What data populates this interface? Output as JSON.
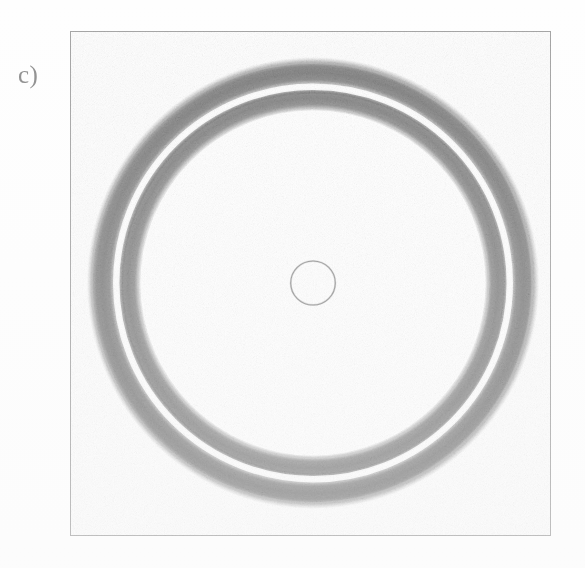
{
  "figure": {
    "panel_label": "c)",
    "caption_text": "",
    "background_color": "#fefefe"
  },
  "frame": {
    "name": "plot-frame",
    "x": 70,
    "y": 31,
    "width": 481,
    "height": 505,
    "border_color": "#b4b4b4",
    "border_width": 1.15
  },
  "chart_data": {
    "type": "scatter",
    "title": "",
    "subtitle": "",
    "xlabel": "",
    "ylabel": "",
    "annotations": [
      "c)"
    ],
    "legend": [],
    "legend_position": "none",
    "grid": false,
    "axis_ticks": false,
    "tick_labels": [],
    "xlim": [
      0,
      1
    ],
    "ylim": [
      0,
      1
    ],
    "center": {
      "x": 313,
      "y": 283
    },
    "ink_color": "#9a9a9a",
    "series": [
      {
        "name": "outer-annulus",
        "shape": "annulus",
        "outer_radius": 222,
        "inner_radius": 200,
        "mean_radius": 211,
        "band_width": 22,
        "fill": "#8f8f8f",
        "opacity": 0.82
      },
      {
        "name": "inner-annulus",
        "shape": "annulus",
        "outer_radius": 193,
        "inner_radius": 174,
        "mean_radius": 183.5,
        "band_width": 19,
        "fill": "#939393",
        "opacity": 0.8
      },
      {
        "name": "separating-gap",
        "shape": "annulus",
        "outer_radius": 200,
        "inner_radius": 193,
        "mean_radius": 196.5,
        "band_width": 7,
        "fill": "#ffffff",
        "opacity": 1.0
      },
      {
        "name": "center-circle",
        "shape": "circle-outline",
        "radius": 22,
        "stroke": "#8c8c8c",
        "stroke_width": 1.1,
        "fill": "none"
      }
    ]
  },
  "colors": {
    "ink_gray": "#9a9a9a",
    "band_dark": "#8a8a8a",
    "band_light": "#b2b2b2",
    "frame_gray": "#b4b4b4",
    "label_gray": "#8e8e8e",
    "paper_white": "#fefefe"
  }
}
